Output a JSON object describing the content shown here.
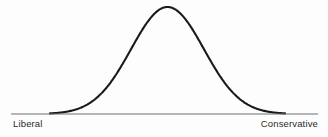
{
  "figure": {
    "name": "bell-curve-ideology-spectrum",
    "background_color": "#fdfdfd",
    "curve_color": "#1a1a1a",
    "axis_color": "#707070",
    "label_color": "#2b2b2b",
    "curve_stroke_width": 2.1,
    "axis_stroke_width": 1.1
  },
  "axis": {
    "left_label": "Liberal",
    "right_label": "Conservative"
  },
  "chart_data": {
    "type": "line",
    "title": "",
    "subtitle": "",
    "xlabel": "",
    "ylabel": "",
    "grid": false,
    "legend": null,
    "annotations": [],
    "axis_tick_labels": [
      "Liberal",
      "Conservative"
    ],
    "xlim": [
      0,
      1
    ],
    "ylim": [
      0,
      1
    ],
    "distribution": {
      "shape": "normal",
      "mean": 0.5,
      "std_dev": 0.155,
      "peak_x": 0.5,
      "peak_y": 1.0
    },
    "pixel_geometry": {
      "baseline_y": 114,
      "baseline_x_start": 11,
      "baseline_x_end": 318,
      "curve_x_start": 50,
      "curve_x_end": 285,
      "peak_x": 161,
      "peak_y": 7
    },
    "x": [
      0.0,
      0.05,
      0.1,
      0.15,
      0.2,
      0.25,
      0.3,
      0.35,
      0.4,
      0.45,
      0.5,
      0.55,
      0.6,
      0.65,
      0.7,
      0.75,
      0.8,
      0.85,
      0.9,
      0.95,
      1.0
    ],
    "values": [
      0.0,
      0.01,
      0.026,
      0.06,
      0.12,
      0.216,
      0.348,
      0.506,
      0.667,
      0.8,
      1.0,
      0.8,
      0.667,
      0.506,
      0.348,
      0.216,
      0.12,
      0.06,
      0.026,
      0.01,
      0.0
    ]
  }
}
